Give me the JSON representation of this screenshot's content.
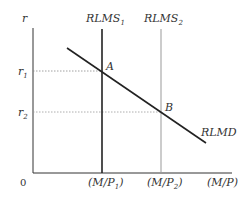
{
  "diagram": {
    "axes": {
      "y_label": "r",
      "x_label": "(M/P)",
      "origin_label": "0"
    },
    "y_ticks": [
      {
        "label": "r",
        "sub": "1"
      },
      {
        "label": "r",
        "sub": "2"
      }
    ],
    "x_ticks": [
      {
        "label": "(M/P",
        "sub": "1",
        "close": ")"
      },
      {
        "label": "(M/P",
        "sub": "2",
        "close": ")"
      }
    ],
    "curves": [
      {
        "name": "RLMS",
        "sub": "1",
        "type": "vertical supply",
        "color": "#222222"
      },
      {
        "name": "RLMS",
        "sub": "2",
        "type": "vertical supply",
        "color": "#999999"
      },
      {
        "name": "RLMD",
        "type": "downward sloping demand",
        "color": "#222222"
      }
    ],
    "points": [
      {
        "label": "A",
        "at": "RLMS1 ∩ RLMD, r1"
      },
      {
        "label": "B",
        "at": "RLMS2 ∩ RLMD, r2"
      }
    ],
    "colors": {
      "axis": "#333333",
      "dark_line": "#222222",
      "light_line": "#999999",
      "dotted": "#888888"
    }
  }
}
